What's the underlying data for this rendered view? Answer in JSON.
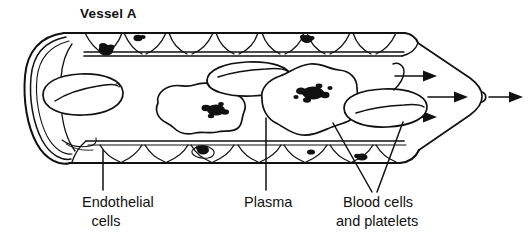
{
  "figure": {
    "title": "Vessel A",
    "type": "blood-vessel-cross-section-diagram",
    "ink_color": "#111111",
    "background_color": "#ffffff"
  },
  "labels": [
    {
      "id": "endothelial-cells",
      "line1": "Endothelial",
      "line2": "cells",
      "points_to": "bottom vessel wall cell layer"
    },
    {
      "id": "plasma",
      "line1": "Plasma",
      "line2": "",
      "points_to": "fluid in vessel lumen"
    },
    {
      "id": "blood-cells-and-platelets",
      "line1": "Blood cells",
      "line2": "and platelets",
      "points_to": "cells suspended in the lumen"
    }
  ],
  "flow": {
    "direction": "rightward",
    "arrow_count": 4
  },
  "cells": {
    "red_blood_cells": 3,
    "white_blood_cells": 3,
    "endothelial_nuclei_top": 2,
    "endothelial_nuclei_bottom": 3
  }
}
